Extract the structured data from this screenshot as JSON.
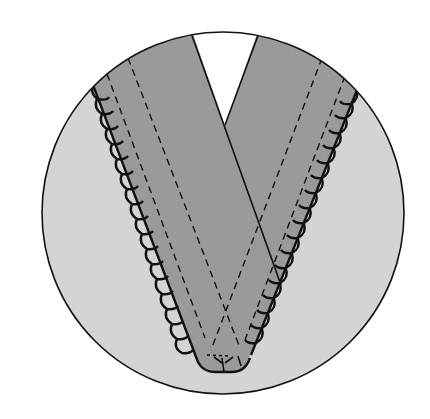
{
  "diagram": {
    "title": "",
    "description": "Circular inset illustration of a V-neck garment with overlapping bands, scalloped outer edges and dashed stitch lines",
    "colors": {
      "background": "#ffffff",
      "circle_fill": "#d4d4d4",
      "band_fill": "#9a9a9a",
      "notch_fill": "#ffffff",
      "outline": "#111111"
    },
    "elements": [
      {
        "name": "circle-inset",
        "label": "Circular detail view"
      },
      {
        "name": "neck-opening",
        "label": "White V-shaped neck opening"
      },
      {
        "name": "left-band",
        "label": "Left neckband (on top)"
      },
      {
        "name": "right-band",
        "label": "Right neckband (underneath)"
      },
      {
        "name": "scalloped-edge",
        "label": "Scalloped / lace trim along outer edges"
      },
      {
        "name": "stitch-lines",
        "label": "Dashed stitching lines"
      }
    ]
  }
}
